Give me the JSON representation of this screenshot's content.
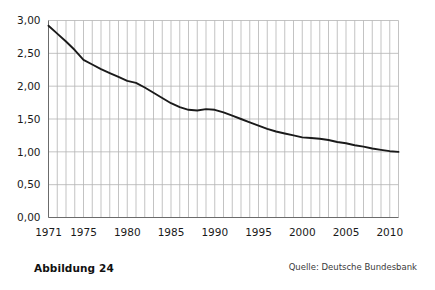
{
  "figure": {
    "caption": "Abbildung 24",
    "source": "Quelle: Deutsche Bundesbank"
  },
  "axis": {
    "y_ticks": [
      "0,00",
      "0,50",
      "1,00",
      "1,50",
      "2,00",
      "2,50",
      "3,00"
    ],
    "x_ticks": [
      "1971",
      "1975",
      "1980",
      "1985",
      "1990",
      "1995",
      "2000",
      "2005",
      "2010"
    ]
  },
  "chart_data": {
    "type": "line",
    "title": "",
    "subtitle": "",
    "xlabel": "",
    "ylabel": "",
    "xlim": [
      1971,
      2011
    ],
    "ylim": [
      0,
      3
    ],
    "ytick_values": [
      0,
      0.5,
      1.0,
      1.5,
      2.0,
      2.5,
      3.0
    ],
    "ytick_labels": [
      "0,00",
      "0,50",
      "1,00",
      "1,50",
      "2,00",
      "2,50",
      "3,00"
    ],
    "xtick_values": [
      1971,
      1975,
      1980,
      1985,
      1990,
      1995,
      2000,
      2005,
      2010
    ],
    "xtick_labels": [
      "1971",
      "1975",
      "1980",
      "1985",
      "1990",
      "1995",
      "2000",
      "2005",
      "2010"
    ],
    "grid": "both",
    "grid_x_every": 1,
    "legend": "none",
    "line_color": "#1a1a1a",
    "grid_color": "#b4b4b4",
    "axis_color": "#888888",
    "series": [
      {
        "name": "Wert",
        "x": [
          1971,
          1972,
          1973,
          1974,
          1975,
          1976,
          1977,
          1978,
          1979,
          1980,
          1981,
          1982,
          1983,
          1984,
          1985,
          1986,
          1987,
          1988,
          1989,
          1990,
          1991,
          1992,
          1993,
          1994,
          1995,
          1996,
          1997,
          1998,
          1999,
          2000,
          2001,
          2002,
          2003,
          2004,
          2005,
          2006,
          2007,
          2008,
          2009,
          2010,
          2011
        ],
        "values": [
          2.92,
          2.8,
          2.68,
          2.55,
          2.4,
          2.33,
          2.26,
          2.2,
          2.14,
          2.08,
          2.05,
          1.98,
          1.9,
          1.82,
          1.74,
          1.68,
          1.64,
          1.63,
          1.65,
          1.64,
          1.6,
          1.55,
          1.5,
          1.45,
          1.4,
          1.35,
          1.31,
          1.28,
          1.25,
          1.22,
          1.21,
          1.2,
          1.18,
          1.15,
          1.13,
          1.1,
          1.08,
          1.05,
          1.03,
          1.01,
          1.0
        ]
      }
    ]
  }
}
